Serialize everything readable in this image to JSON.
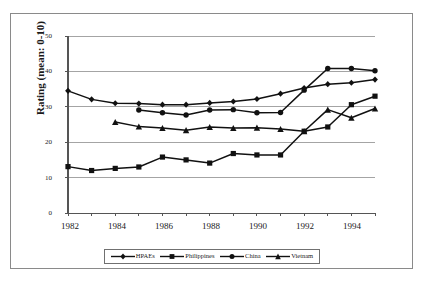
{
  "chart_data": {
    "type": "line",
    "title": "",
    "xlabel": "",
    "ylabel": "Rating (mean: 0-10)",
    "xlim": [
      1982,
      1995
    ],
    "ylim": [
      0,
      50
    ],
    "yticks": [
      0,
      10,
      20,
      30,
      40,
      50
    ],
    "xticks": [
      1982,
      1983,
      1984,
      1985,
      1986,
      1987,
      1988,
      1989,
      1990,
      1991,
      1992,
      1993,
      1994,
      1995
    ],
    "xtick_labels": [
      "1982",
      "",
      "1984",
      "",
      "1986",
      "",
      "1988",
      "",
      "1990",
      "",
      "1992",
      "",
      "1994",
      ""
    ],
    "ytick_labels": [
      "0",
      "10",
      "20",
      "30",
      "40",
      "50"
    ],
    "grid": "horizontal",
    "legend_position": "bottom",
    "x": [
      1982,
      1983,
      1984,
      1985,
      1986,
      1987,
      1988,
      1989,
      1990,
      1991,
      1992,
      1993,
      1994,
      1995
    ],
    "series": [
      {
        "name": "HPAEs",
        "marker": "diamond",
        "values": [
          34.5,
          32.1,
          31.0,
          30.9,
          30.6,
          30.6,
          31.1,
          31.5,
          32.2,
          33.7,
          35.3,
          36.4,
          36.8,
          37.7
        ]
      },
      {
        "name": "Philippines",
        "marker": "square",
        "values": [
          13.1,
          12.0,
          12.6,
          13.0,
          15.8,
          15.0,
          14.1,
          16.8,
          16.4,
          16.4,
          23.1,
          24.3,
          30.6,
          33.0
        ]
      },
      {
        "name": "China",
        "marker": "circle",
        "values": [
          null,
          null,
          null,
          29.1,
          28.3,
          27.7,
          29.1,
          29.2,
          28.3,
          28.4,
          34.7,
          40.8,
          40.8,
          40.2
        ]
      },
      {
        "name": "Vietnam",
        "marker": "triangle",
        "values": [
          null,
          null,
          25.7,
          24.4,
          24.0,
          23.4,
          24.3,
          24.0,
          24.1,
          23.7,
          23.1,
          29.2,
          26.9,
          29.5
        ]
      }
    ]
  },
  "legend": {
    "items": [
      {
        "label": "HPAEs"
      },
      {
        "label": "Philippines"
      },
      {
        "label": "China"
      },
      {
        "label": "Vietnam"
      }
    ]
  },
  "axis": {
    "y_title": "Rating (mean: 0-10)",
    "y_ticks": [
      "50",
      "40",
      "30",
      "20",
      "10",
      "0"
    ],
    "x_ticks": [
      "1982",
      "1984",
      "1986",
      "1988",
      "1990",
      "1992",
      "1994"
    ]
  },
  "colors": {
    "line": "#111111",
    "grid": "#9a9a9a",
    "axis": "#555555",
    "frame": "#8a8a8a",
    "background": "#ffffff"
  }
}
